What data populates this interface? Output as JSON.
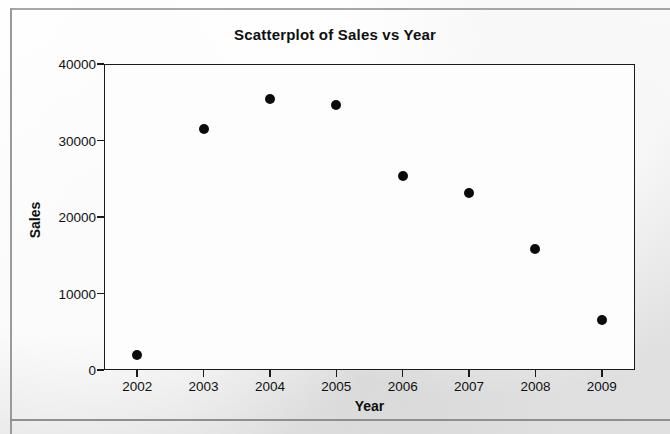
{
  "chart_data": {
    "type": "scatter",
    "title": "Scatterplot of Sales vs Year",
    "xlabel": "Year",
    "ylabel": "Sales",
    "x": [
      2002,
      2003,
      2004,
      2005,
      2006,
      2007,
      2008,
      2009
    ],
    "values": [
      2000,
      31500,
      35400,
      34600,
      25400,
      23200,
      15800,
      6600
    ],
    "series": [
      {
        "name": "Sales",
        "points": [
          {
            "x": 2002,
            "y": 2000
          },
          {
            "x": 2003,
            "y": 31500
          },
          {
            "x": 2004,
            "y": 35400
          },
          {
            "x": 2005,
            "y": 34600
          },
          {
            "x": 2006,
            "y": 25400
          },
          {
            "x": 2007,
            "y": 23200
          },
          {
            "x": 2008,
            "y": 15800
          },
          {
            "x": 2009,
            "y": 6600
          }
        ]
      }
    ],
    "xlim": [
      2001.5,
      2009.5
    ],
    "ylim": [
      0,
      40000
    ],
    "xticks": [
      "2002",
      "2003",
      "2004",
      "2005",
      "2006",
      "2007",
      "2008",
      "2009"
    ],
    "xtick_values": [
      2002,
      2003,
      2004,
      2005,
      2006,
      2007,
      2008,
      2009
    ],
    "yticks": [
      "0",
      "10000",
      "20000",
      "30000",
      "40000"
    ],
    "ytick_values": [
      0,
      10000,
      20000,
      30000,
      40000
    ],
    "grid": false,
    "legend": null,
    "marker": "filled-circle",
    "marker_color": "#0b0b0b",
    "plot_background": "#fdfdfd",
    "page_background": "#ededed",
    "axis_color": "#1a1a1a"
  }
}
